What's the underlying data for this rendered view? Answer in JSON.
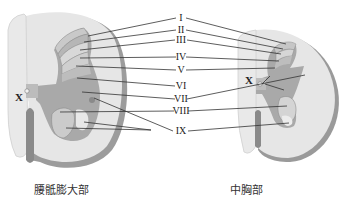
{
  "diagram": {
    "type": "anatomical cross-section of spinal cord showing Rexed laminae",
    "laminae_labels": [
      "I",
      "II",
      "III",
      "IV",
      "V",
      "VI",
      "VII",
      "VIII",
      "IX"
    ],
    "central_canal_label": "X",
    "sections": [
      {
        "id": "lumbosacral",
        "caption": "腰骶膨大部"
      },
      {
        "id": "mid-thoracic",
        "caption": "中胸部"
      }
    ],
    "colors": {
      "white_matter": "#e4e4e4",
      "white_matter_edge": "#9a9a9a",
      "gray_matter": "#a9a9a9",
      "lamina_light": "#d2d2d2",
      "line": "#333333"
    }
  }
}
